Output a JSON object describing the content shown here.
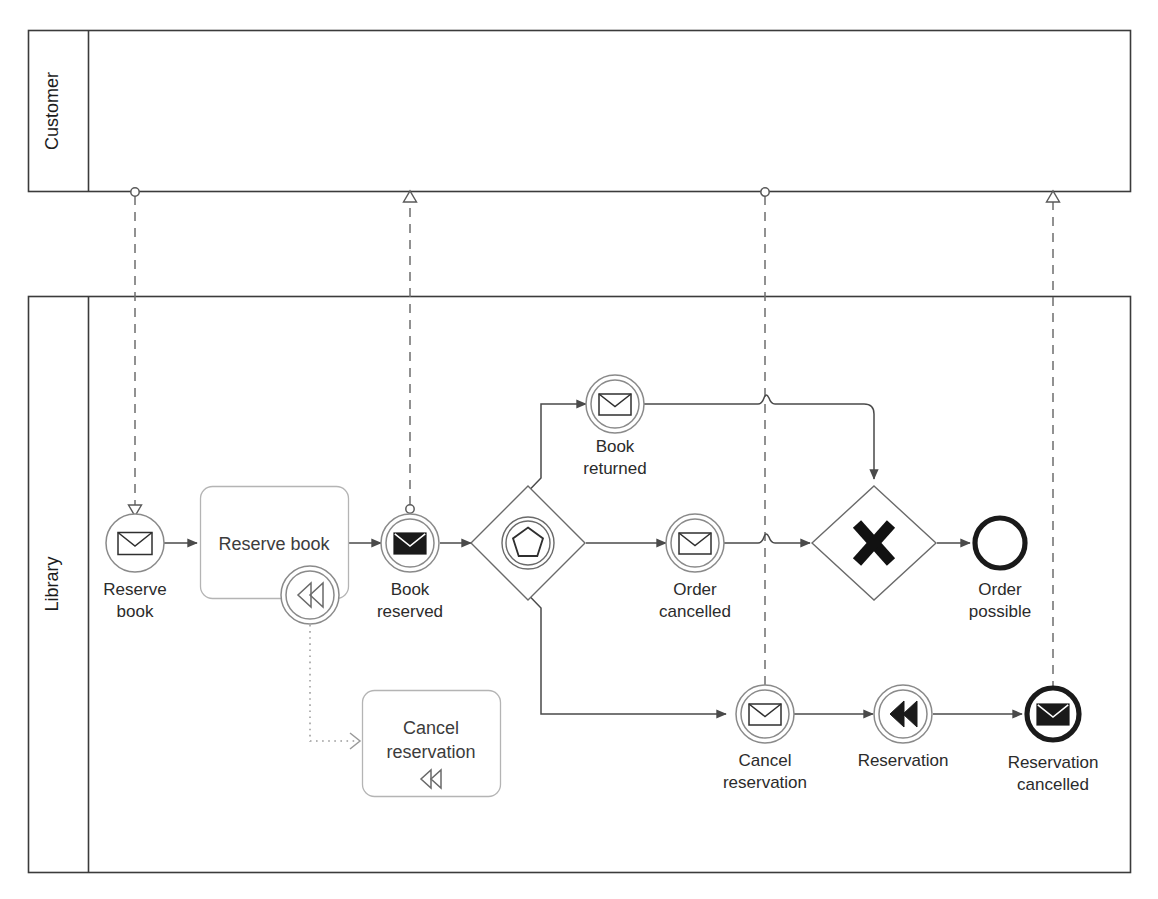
{
  "diagram": {
    "notation": "BPMN 2.0",
    "colors": {
      "stroke": "#4a4a4a",
      "pool_border": "#3b3b3b",
      "task_border": "#b4b4b4",
      "text": "#2b2b2b",
      "background": "#ffffff",
      "bold_event": "#1a1a1a"
    }
  },
  "pools": [
    {
      "id": "pool-customer",
      "label": "Customer",
      "label_orientation": "vertical",
      "empty": true
    },
    {
      "id": "pool-library",
      "label": "Library",
      "label_orientation": "vertical",
      "empty": false
    }
  ],
  "elements": [
    {
      "id": "start-reserve-book",
      "type": "start-event",
      "event_definition": "message",
      "marker": "envelope-outline",
      "label_lines": [
        "Reserve",
        "book"
      ],
      "label": "Reserve book"
    },
    {
      "id": "task-reserve-book",
      "type": "task",
      "label_lines": [
        "Reserve book"
      ],
      "label": "Reserve book",
      "boundary_event": {
        "id": "boundary-compensation",
        "type": "boundary-event",
        "event_definition": "compensation",
        "marker": "rewind-outline",
        "label": ""
      }
    },
    {
      "id": "throw-book-reserved",
      "type": "intermediate-throw-event",
      "event_definition": "message",
      "marker": "envelope-solid",
      "label_lines": [
        "Book",
        "reserved"
      ],
      "label": "Book reserved"
    },
    {
      "id": "gateway-event-based",
      "type": "event-based-gateway",
      "marker": "pentagon-in-double-circle",
      "label": ""
    },
    {
      "id": "catch-book-returned",
      "type": "intermediate-catch-event",
      "event_definition": "message",
      "marker": "envelope-outline",
      "label_lines": [
        "Book",
        "returned"
      ],
      "label": "Book returned"
    },
    {
      "id": "catch-order-cancelled",
      "type": "intermediate-catch-event",
      "event_definition": "message",
      "marker": "envelope-outline",
      "label_lines": [
        "Order",
        "cancelled"
      ],
      "label": "Order cancelled"
    },
    {
      "id": "gateway-exclusive",
      "type": "exclusive-gateway",
      "marker": "x-cross",
      "label": ""
    },
    {
      "id": "end-order-possible",
      "type": "end-event",
      "event_definition": "none",
      "marker": "none",
      "label_lines": [
        "Order",
        "possible"
      ],
      "label": "Order possible"
    },
    {
      "id": "task-cancel-reservation",
      "type": "compensation-task",
      "label_lines": [
        "Cancel",
        "reservation"
      ],
      "label": "Cancel reservation",
      "marker": "rewind-outline"
    },
    {
      "id": "catch-cancel-reservation",
      "type": "intermediate-catch-event",
      "event_definition": "message",
      "marker": "envelope-outline",
      "label_lines": [
        "Cancel",
        "reservation"
      ],
      "label": "Cancel reservation"
    },
    {
      "id": "throw-reservation-compensation",
      "type": "intermediate-throw-event",
      "event_definition": "compensation",
      "marker": "rewind-solid",
      "label_lines": [
        "Reservation"
      ],
      "label": "Reservation"
    },
    {
      "id": "end-reservation-cancelled",
      "type": "message-end-event",
      "event_definition": "message",
      "marker": "envelope-solid",
      "label_lines": [
        "Reservation",
        "cancelled"
      ],
      "label": "Reservation cancelled"
    }
  ],
  "connections": {
    "sequence_flows": [
      {
        "from": "start-reserve-book",
        "to": "task-reserve-book"
      },
      {
        "from": "task-reserve-book",
        "to": "throw-book-reserved"
      },
      {
        "from": "throw-book-reserved",
        "to": "gateway-event-based"
      },
      {
        "from": "gateway-event-based",
        "to": "catch-book-returned"
      },
      {
        "from": "gateway-event-based",
        "to": "catch-order-cancelled"
      },
      {
        "from": "gateway-event-based",
        "to": "catch-cancel-reservation"
      },
      {
        "from": "catch-book-returned",
        "to": "gateway-exclusive"
      },
      {
        "from": "catch-order-cancelled",
        "to": "gateway-exclusive"
      },
      {
        "from": "gateway-exclusive",
        "to": "end-order-possible"
      },
      {
        "from": "catch-cancel-reservation",
        "to": "throw-reservation-compensation"
      },
      {
        "from": "throw-reservation-compensation",
        "to": "end-reservation-cancelled"
      }
    ],
    "message_flows": [
      {
        "id": "mf-1",
        "from": "pool-customer",
        "to": "start-reserve-book",
        "direction": "down"
      },
      {
        "id": "mf-2",
        "from": "throw-book-reserved",
        "to": "pool-customer",
        "direction": "up"
      },
      {
        "id": "mf-3",
        "from": "pool-customer",
        "to": "catch-cancel-reservation",
        "direction": "down"
      },
      {
        "id": "mf-4",
        "from": "end-reservation-cancelled",
        "to": "pool-customer",
        "direction": "up"
      }
    ],
    "associations": [
      {
        "id": "assoc-1",
        "from": "boundary-compensation",
        "to": "task-cancel-reservation",
        "style": "dotted"
      }
    ]
  }
}
